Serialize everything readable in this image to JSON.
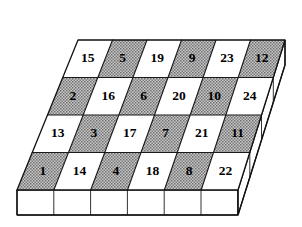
{
  "figure": {
    "grid": {
      "rows": 4,
      "cols": 6,
      "total_cells": 24
    },
    "colors": {
      "shaded_cell": "#9b9b9b",
      "plain_cell": "#ffffff",
      "outline": "#111111",
      "label": "#000000",
      "side_face": "#ffffff"
    },
    "cells": [
      [
        {
          "label": "15",
          "shade": "plain"
        },
        {
          "label": "5",
          "shade": "shaded"
        },
        {
          "label": "19",
          "shade": "plain"
        },
        {
          "label": "9",
          "shade": "shaded"
        },
        {
          "label": "23",
          "shade": "plain"
        },
        {
          "label": "12",
          "shade": "shaded"
        }
      ],
      [
        {
          "label": "2",
          "shade": "shaded"
        },
        {
          "label": "16",
          "shade": "plain"
        },
        {
          "label": "6",
          "shade": "shaded"
        },
        {
          "label": "20",
          "shade": "plain"
        },
        {
          "label": "10",
          "shade": "shaded"
        },
        {
          "label": "24",
          "shade": "plain"
        }
      ],
      [
        {
          "label": "13",
          "shade": "plain"
        },
        {
          "label": "3",
          "shade": "shaded"
        },
        {
          "label": "17",
          "shade": "plain"
        },
        {
          "label": "7",
          "shade": "shaded"
        },
        {
          "label": "21",
          "shade": "plain"
        },
        {
          "label": "11",
          "shade": "shaded"
        }
      ],
      [
        {
          "label": "1",
          "shade": "shaded"
        },
        {
          "label": "14",
          "shade": "plain"
        },
        {
          "label": "4",
          "shade": "shaded"
        },
        {
          "label": "18",
          "shade": "plain"
        },
        {
          "label": "8",
          "shade": "shaded"
        },
        {
          "label": "22",
          "shade": "plain"
        }
      ]
    ],
    "front_face": {
      "panels": 6
    },
    "right_face": {
      "panels": 4
    }
  }
}
